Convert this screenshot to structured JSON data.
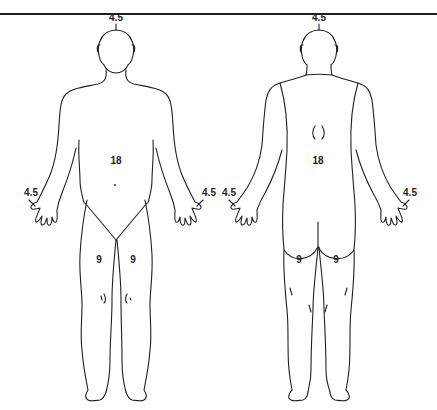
{
  "diagram": {
    "title": "",
    "colors": {
      "line": "#231f20",
      "background": "#ffffff"
    },
    "figures": [
      {
        "view": "anterior",
        "labels": {
          "head": "4.5",
          "trunk": "18",
          "right_arm": "4.5",
          "left_arm": "4.5",
          "right_leg": "9",
          "left_leg": "9"
        }
      },
      {
        "view": "posterior",
        "labels": {
          "head": "4.5",
          "trunk": "18",
          "left_arm": "4.5",
          "right_arm": "4.5",
          "left_leg": "9",
          "right_leg": "9"
        }
      }
    ]
  }
}
